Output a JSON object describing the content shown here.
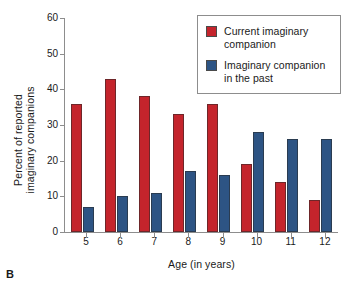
{
  "panel_letter": "B",
  "legend": {
    "position": "top-right",
    "entries": [
      {
        "label": "Current imaginary companion",
        "color": "#c4242c",
        "swatch_name": "legend-swatch-current"
      },
      {
        "label": "Imaginary companion in the past",
        "color": "#2d5484",
        "swatch_name": "legend-swatch-past"
      }
    ]
  },
  "chart_data": {
    "type": "bar",
    "title": "",
    "subtitle": "",
    "xlabel": "Age (in years)",
    "ylabel": "Percent of reported imaginary companions",
    "ylabel_lines": [
      "Percent of reported",
      "imaginary companions"
    ],
    "categories": [
      "5",
      "6",
      "7",
      "8",
      "9",
      "10",
      "11",
      "12"
    ],
    "ylim": [
      0,
      60
    ],
    "yticks": [
      0,
      10,
      20,
      30,
      40,
      50,
      60
    ],
    "ytick_labels": [
      "0",
      "10",
      "20",
      "30",
      "40",
      "50",
      "60"
    ],
    "grid": false,
    "legend_position": "top-right",
    "series": [
      {
        "name": "Current imaginary companion",
        "color": "#c4242c",
        "values": [
          36,
          43,
          38,
          33,
          36,
          19,
          14,
          9
        ]
      },
      {
        "name": "Imaginary companion in the past",
        "color": "#2d5484",
        "values": [
          7,
          10,
          11,
          17,
          16,
          28,
          26,
          26
        ]
      }
    ]
  }
}
